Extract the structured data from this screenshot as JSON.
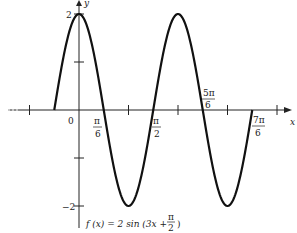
{
  "chart_data": {
    "type": "line",
    "title": "",
    "function_label": "f(x) = 2 sin (3x + π/2)",
    "xlabel": "x",
    "ylabel": "y",
    "x_ticks": [
      {
        "value": 0,
        "label": "0"
      },
      {
        "value": 0.5236,
        "label": "π/6"
      },
      {
        "value": 1.5708,
        "label": "π/2"
      },
      {
        "value": 2.618,
        "label": "5π/6"
      },
      {
        "value": 3.6652,
        "label": "7π/6"
      }
    ],
    "y_ticks": [
      {
        "value": 2,
        "label": "2"
      },
      {
        "value": -2,
        "label": "−2"
      }
    ],
    "domain": [
      -0.5236,
      3.6652
    ],
    "ylim": [
      -2,
      2
    ],
    "series": [
      {
        "name": "f(x) = 2 sin(3x + π/2)",
        "x": [
          -0.5236,
          0,
          0.5236,
          1.0472,
          1.5708,
          2.0944,
          2.618,
          3.1416,
          3.6652
        ],
        "values": [
          0,
          2,
          0,
          -2,
          0,
          2,
          0,
          -2,
          0
        ]
      }
    ],
    "grid": false,
    "legend": "none"
  },
  "labels": {
    "x_axis": "x",
    "y_axis": "y",
    "origin": "0",
    "y_max": "2",
    "y_min": "−2",
    "pi6_num": "π",
    "pi6_den": "6",
    "pi2_num": "π",
    "pi2_den": "2",
    "fivepi6_num": "5π",
    "fivepi6_den": "6",
    "sevenpi6_num": "7π",
    "sevenpi6_den": "6",
    "func_prefix": "f (x) = 2 sin (3x +",
    "func_frac_num": "π",
    "func_frac_den": "2",
    "func_suffix": ")"
  }
}
